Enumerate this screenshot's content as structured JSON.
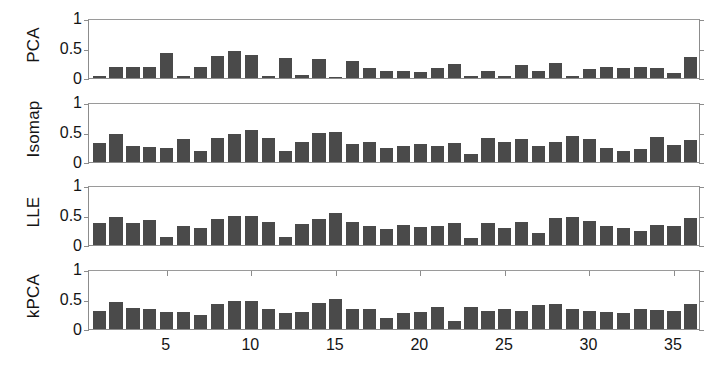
{
  "figure": {
    "background_color": "#ffffff",
    "bar_color": "#4a4a4a",
    "axis_color": "#8c8c8c",
    "text_color": "#141414"
  },
  "chart_data": {
    "type": "bar",
    "title": "",
    "xlabel": "",
    "ylabel": "",
    "grid": false,
    "legend": "none",
    "xlim": [
      0.4,
      36.6
    ],
    "ylim": [
      0,
      1
    ],
    "xticks": [
      5,
      10,
      15,
      20,
      25,
      30,
      35
    ],
    "xtick_labels": [
      "5",
      "10",
      "15",
      "20",
      "25",
      "30",
      "35"
    ],
    "yticks": [
      0,
      0.5,
      1
    ],
    "ytick_labels": [
      "0",
      "0.5",
      "1"
    ],
    "x": [
      1,
      2,
      3,
      4,
      5,
      6,
      7,
      8,
      9,
      10,
      11,
      12,
      13,
      14,
      15,
      16,
      17,
      18,
      19,
      20,
      21,
      22,
      23,
      24,
      25,
      26,
      27,
      28,
      29,
      30,
      31,
      32,
      33,
      34,
      35,
      36
    ],
    "panels": [
      {
        "name": "PCA",
        "label": "PCA",
        "values": [
          0.03,
          0.19,
          0.19,
          0.19,
          0.41,
          0.04,
          0.18,
          0.37,
          0.45,
          0.39,
          0.03,
          0.33,
          0.05,
          0.31,
          0.02,
          0.28,
          0.17,
          0.12,
          0.11,
          0.1,
          0.16,
          0.23,
          0.04,
          0.12,
          0.03,
          0.21,
          0.11,
          0.25,
          0.03,
          0.15,
          0.18,
          0.16,
          0.18,
          0.16,
          0.09,
          0.35
        ]
      },
      {
        "name": "Isomap",
        "label": "Isomap",
        "values": [
          0.31,
          0.46,
          0.27,
          0.25,
          0.23,
          0.39,
          0.19,
          0.4,
          0.47,
          0.53,
          0.4,
          0.19,
          0.33,
          0.49,
          0.5,
          0.3,
          0.34,
          0.24,
          0.27,
          0.3,
          0.27,
          0.32,
          0.14,
          0.4,
          0.33,
          0.38,
          0.26,
          0.34,
          0.43,
          0.39,
          0.23,
          0.19,
          0.21,
          0.41,
          0.29,
          0.37
        ]
      },
      {
        "name": "LLE",
        "label": "LLE",
        "values": [
          0.37,
          0.46,
          0.36,
          0.41,
          0.13,
          0.32,
          0.28,
          0.44,
          0.48,
          0.48,
          0.39,
          0.14,
          0.35,
          0.44,
          0.54,
          0.38,
          0.31,
          0.27,
          0.34,
          0.3,
          0.32,
          0.36,
          0.11,
          0.37,
          0.29,
          0.38,
          0.2,
          0.45,
          0.47,
          0.4,
          0.32,
          0.28,
          0.23,
          0.33,
          0.32,
          0.45
        ]
      },
      {
        "name": "kPCA",
        "label": "kPCA",
        "values": [
          0.3,
          0.45,
          0.35,
          0.34,
          0.28,
          0.29,
          0.23,
          0.42,
          0.47,
          0.47,
          0.33,
          0.27,
          0.29,
          0.43,
          0.5,
          0.33,
          0.33,
          0.19,
          0.26,
          0.29,
          0.36,
          0.13,
          0.37,
          0.3,
          0.34,
          0.3,
          0.4,
          0.41,
          0.33,
          0.3,
          0.28,
          0.26,
          0.33,
          0.31,
          0.3,
          0.42
        ]
      }
    ]
  }
}
